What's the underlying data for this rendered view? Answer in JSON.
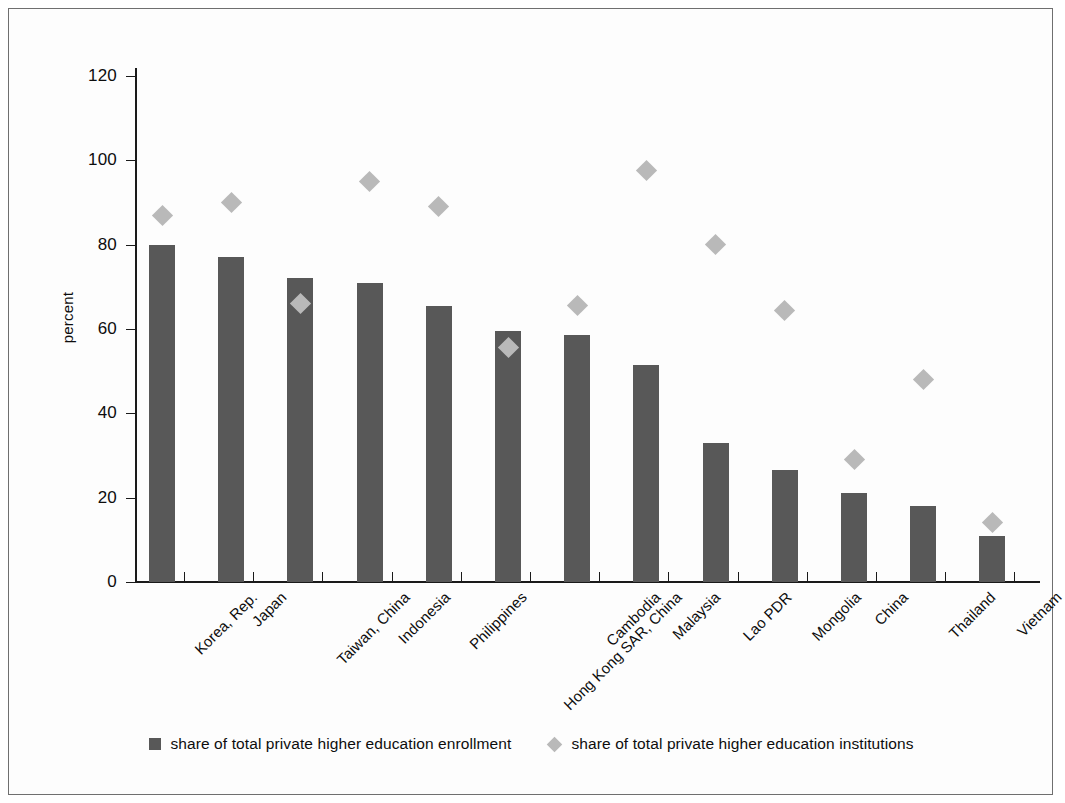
{
  "chart_data": {
    "type": "bar",
    "title": "",
    "subtitle": "",
    "xlabel": "",
    "ylabel": "percent",
    "ylim": [
      0,
      120
    ],
    "yticks": [
      0,
      20,
      40,
      60,
      80,
      100,
      120
    ],
    "grid": false,
    "legend_position": "bottom",
    "categories": [
      "Korea, Rep.",
      "Japan",
      "Taiwan, China",
      "Indonesia",
      "Philippines",
      "Hong Kong SAR, China",
      "Cambodia",
      "Malaysia",
      "Lao PDR",
      "Mongolia",
      "China",
      "Thailand",
      "Vietnam"
    ],
    "series": [
      {
        "name": "share of total private higher education enrollment",
        "marker": "bar",
        "color": "#585858",
        "values": [
          80,
          77,
          72,
          71,
          65.5,
          59.5,
          58.5,
          51.5,
          33,
          26.5,
          21,
          18,
          11
        ]
      },
      {
        "name": "share of total private higher education institutions",
        "marker": "diamond",
        "color": "#b9b9b9",
        "values": [
          87,
          90,
          66,
          95,
          89,
          55.5,
          65.5,
          97.5,
          80,
          64.5,
          29,
          48,
          14
        ]
      }
    ]
  },
  "axes": {
    "y_title": "percent",
    "y_tick_labels": [
      "120",
      "100",
      "80",
      "60",
      "40",
      "20",
      "0"
    ]
  },
  "legend": {
    "items": [
      {
        "label": "share of total private higher education enrollment",
        "swatch": "square-swatch-icon"
      },
      {
        "label": "share of total private higher education institutions",
        "swatch": "diamond-swatch-icon"
      }
    ]
  }
}
